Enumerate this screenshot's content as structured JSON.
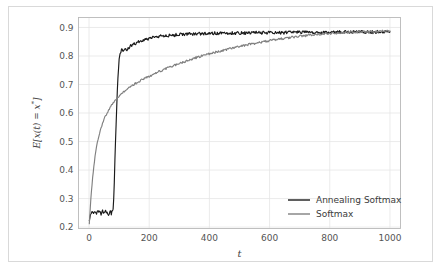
{
  "figure": {
    "background_color": "#ffffff",
    "frame_color": "#d9d9d9",
    "grid_color": "#e6e6e6",
    "spine_color": "#b9b9b9"
  },
  "chart_data": {
    "type": "line",
    "title": "",
    "xlabel": "t",
    "ylabel": "E[x(t) = x*]",
    "xlim": [
      -35,
      1035
    ],
    "ylim": [
      0.195,
      0.935
    ],
    "xticks": [
      0,
      200,
      400,
      600,
      800,
      1000
    ],
    "xtick_labels": [
      "0",
      "200",
      "400",
      "600",
      "800",
      "1000"
    ],
    "yticks": [
      0.2,
      0.3,
      0.4,
      0.5,
      0.6,
      0.7,
      0.8,
      0.9
    ],
    "ytick_labels": [
      "0.2",
      "0.3",
      "0.4",
      "0.5",
      "0.6",
      "0.7",
      "0.8",
      "0.9"
    ],
    "grid": true,
    "legend_position": "lower right",
    "series": [
      {
        "name": "Annealing Softmax",
        "color": "#1a1a1a",
        "x": [
          1,
          5,
          10,
          15,
          20,
          25,
          30,
          35,
          40,
          45,
          50,
          55,
          60,
          65,
          70,
          72,
          74,
          76,
          78,
          80,
          82,
          84,
          86,
          88,
          90,
          92,
          94,
          96,
          98,
          100,
          103,
          106,
          110,
          114,
          118,
          122,
          126,
          130,
          140,
          150,
          160,
          170,
          180,
          190,
          200,
          220,
          240,
          260,
          280,
          300,
          330,
          360,
          390,
          420,
          450,
          480,
          520,
          560,
          600,
          650,
          700,
          750,
          800,
          850,
          900,
          950,
          1000
        ],
        "y": [
          0.225,
          0.243,
          0.252,
          0.247,
          0.256,
          0.249,
          0.258,
          0.251,
          0.246,
          0.255,
          0.248,
          0.257,
          0.252,
          0.245,
          0.259,
          0.253,
          0.247,
          0.258,
          0.262,
          0.268,
          0.3,
          0.36,
          0.43,
          0.5,
          0.565,
          0.625,
          0.675,
          0.72,
          0.758,
          0.788,
          0.806,
          0.818,
          0.822,
          0.817,
          0.823,
          0.826,
          0.824,
          0.829,
          0.836,
          0.842,
          0.847,
          0.851,
          0.855,
          0.858,
          0.861,
          0.866,
          0.869,
          0.871,
          0.873,
          0.875,
          0.877,
          0.878,
          0.879,
          0.88,
          0.88,
          0.881,
          0.881,
          0.882,
          0.882,
          0.882,
          0.883,
          0.883,
          0.883,
          0.884,
          0.884,
          0.884,
          0.885
        ]
      },
      {
        "name": "Softmax",
        "color": "#808080",
        "x": [
          1,
          4,
          8,
          12,
          16,
          20,
          25,
          30,
          35,
          40,
          45,
          50,
          55,
          60,
          65,
          70,
          75,
          80,
          85,
          90,
          95,
          100,
          110,
          120,
          130,
          140,
          150,
          160,
          170,
          180,
          190,
          200,
          215,
          230,
          245,
          260,
          275,
          290,
          305,
          320,
          335,
          350,
          365,
          380,
          395,
          410,
          430,
          450,
          470,
          490,
          510,
          530,
          550,
          570,
          590,
          610,
          630,
          650,
          670,
          690,
          710,
          730,
          750,
          770,
          790,
          810,
          830,
          850,
          870,
          890,
          910,
          930,
          950,
          970,
          990,
          1000
        ],
        "y": [
          0.215,
          0.265,
          0.325,
          0.375,
          0.415,
          0.448,
          0.482,
          0.508,
          0.53,
          0.548,
          0.563,
          0.578,
          0.59,
          0.6,
          0.61,
          0.619,
          0.627,
          0.634,
          0.641,
          0.648,
          0.654,
          0.66,
          0.67,
          0.679,
          0.687,
          0.694,
          0.701,
          0.707,
          0.713,
          0.719,
          0.724,
          0.729,
          0.737,
          0.744,
          0.751,
          0.757,
          0.764,
          0.77,
          0.776,
          0.781,
          0.787,
          0.792,
          0.797,
          0.802,
          0.806,
          0.81,
          0.816,
          0.821,
          0.826,
          0.831,
          0.835,
          0.84,
          0.844,
          0.848,
          0.852,
          0.856,
          0.859,
          0.862,
          0.865,
          0.868,
          0.871,
          0.873,
          0.875,
          0.877,
          0.878,
          0.88,
          0.881,
          0.882,
          0.883,
          0.884,
          0.885,
          0.886,
          0.886,
          0.887,
          0.888,
          0.888
        ]
      }
    ]
  },
  "legend": {
    "entries": [
      {
        "label": "Annealing Softmax",
        "color": "#1a1a1a"
      },
      {
        "label": "Softmax",
        "color": "#808080"
      }
    ]
  }
}
